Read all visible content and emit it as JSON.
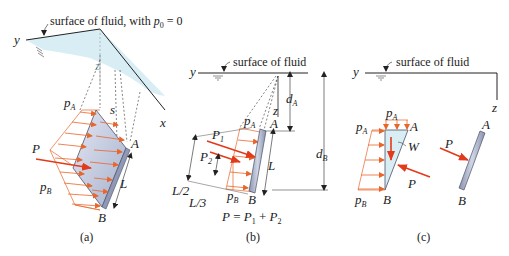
{
  "figure": {
    "colors": {
      "pressure_arrow": "#e8662a",
      "resultant_arrow": "#e23a1a",
      "plate_fill": "#b9c2d8",
      "plate_edge": "#4a5068",
      "fluid_fill": "#d8eef4",
      "line": "#222222",
      "dashed": "#333333"
    },
    "panel_a": {
      "caption": "(a)",
      "surface_label": "surface of fluid, with ",
      "p0_var": "p",
      "p0_sub": "0",
      "p0_eq": " = 0",
      "axis_y": "y",
      "axis_x": "x",
      "axis_z": "z",
      "pA": "p",
      "pA_sub": "A",
      "pB": "p",
      "pB_sub": "B",
      "P": "P",
      "s": "s",
      "A": "A",
      "B": "B",
      "L": "L"
    },
    "panel_b": {
      "caption": "(b)",
      "surface_label": "surface of fluid",
      "axis_y": "y",
      "axis_z": "z",
      "dA": "d",
      "dA_sub": "A",
      "dB": "d",
      "dB_sub": "B",
      "pA": "p",
      "pA_sub": "A",
      "pB": "p",
      "pB_sub": "B",
      "P1": "P",
      "P1_sub": "1",
      "P2": "P",
      "P2_sub": "2",
      "A": "A",
      "B": "B",
      "L": "L",
      "L_half": "L/2",
      "L_third": "L/3",
      "equation_lhs": "P",
      "equation_eq": " = ",
      "equation_t1": "P",
      "equation_t1_sub": "1",
      "equation_plus": " + ",
      "equation_t2": "P",
      "equation_t2_sub": "2"
    },
    "panel_c": {
      "caption": "(c)",
      "surface_label": "surface of fluid",
      "axis_y": "y",
      "axis_z": "z",
      "pA_top": "p",
      "pA_top_sub": "A",
      "pA_left": "p",
      "pA_left_sub": "A",
      "pB": "p",
      "pB_sub": "B",
      "W": "W",
      "P_fluid": "P",
      "P_plate": "P",
      "A_fluid": "A",
      "B_fluid": "B",
      "A_plate": "A",
      "B_plate": "B"
    }
  }
}
